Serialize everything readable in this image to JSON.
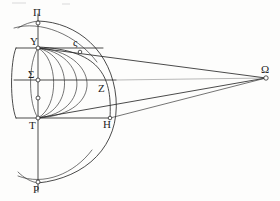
{
  "figure": {
    "ink_color": "#2b2b2b",
    "paper_color": "#fdfdfc",
    "labels": {
      "pole_top": "Π",
      "upper_tropic": "Y",
      "equator": "Σ",
      "arc_point_upper": "ς",
      "arc_point_mid": "Z",
      "lower_tropic": "T",
      "arc_point_lower": "H",
      "pole_bottom": "P",
      "eye_point": "Ω"
    },
    "points": {
      "pole_top": {
        "x": 38,
        "y": 23
      },
      "upper_tropic": {
        "x": 38,
        "y": 48
      },
      "equator": {
        "x": 38,
        "y": 80
      },
      "axis_mid": {
        "x": 38,
        "y": 98
      },
      "lower_tropic": {
        "x": 38,
        "y": 118
      },
      "pole_bottom": {
        "x": 38,
        "y": 182
      },
      "arc_point_upper": {
        "x": 80,
        "y": 49
      },
      "arc_point_mid": {
        "x": 103,
        "y": 80
      },
      "arc_point_lower": {
        "x": 110,
        "y": 118
      },
      "eye_point": {
        "x": 266,
        "y": 78
      }
    },
    "geometry": {
      "sphere_center_x": 38,
      "sphere_center_y": 98,
      "sphere_radius": 78,
      "equator_line_y": 80,
      "upper_tropic_y": 48,
      "lower_tropic_y": 118,
      "meridian_count": 5,
      "sight_lines": 3
    }
  }
}
